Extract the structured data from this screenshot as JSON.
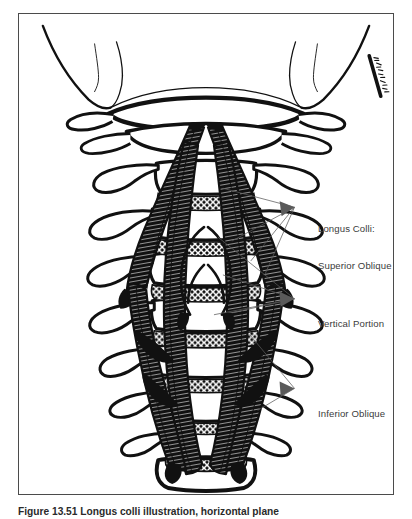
{
  "figure": {
    "frame_color": "#4b4b4b",
    "background_color": "#ffffff",
    "ink_color": "#111111"
  },
  "labels": [
    {
      "id": "superior-oblique",
      "line1": "Longus Colli:",
      "line2": "Superior Oblique",
      "text": "Longus Colli: Superior Oblique"
    },
    {
      "id": "vertical-portion",
      "line1": "Vertical Portion",
      "line2": "",
      "text": "Vertical Portion"
    },
    {
      "id": "inferior-oblique",
      "line1": "Inferior Oblique",
      "line2": "",
      "text": "Inferior Oblique"
    }
  ],
  "signature": {
    "text": "artist-signature",
    "legible": false
  },
  "caption": {
    "label": "Figure",
    "number": "13.51",
    "text": "Figure 13.51 Longus colli illustration, horizontal plane"
  }
}
